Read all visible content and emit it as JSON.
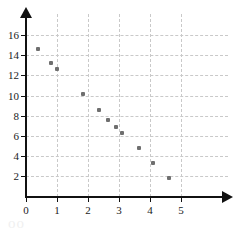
{
  "chart_data": {
    "type": "scatter",
    "title": "",
    "subtitle": "",
    "xlabel": "",
    "ylabel": "",
    "xlim": [
      0,
      5.7
    ],
    "ylim": [
      0,
      17.3
    ],
    "grid": true,
    "legend": null,
    "x_ticks": [
      "0",
      "1",
      "2",
      "3",
      "4",
      "5"
    ],
    "x_tick_values": [
      0,
      1,
      2,
      3,
      4,
      5
    ],
    "y_ticks": [
      "2",
      "4",
      "6",
      "8",
      "10",
      "12",
      "14",
      "16"
    ],
    "y_tick_values": [
      2,
      4,
      6,
      8,
      10,
      12,
      14,
      16
    ],
    "series": [
      {
        "name": "data",
        "marker": "square",
        "color": "#6f6f6f",
        "points": [
          {
            "x": 0.4,
            "y": 14.6
          },
          {
            "x": 0.8,
            "y": 13.2
          },
          {
            "x": 1.0,
            "y": 12.6
          },
          {
            "x": 1.85,
            "y": 10.1
          },
          {
            "x": 2.35,
            "y": 8.6
          },
          {
            "x": 2.65,
            "y": 7.6
          },
          {
            "x": 2.9,
            "y": 6.9
          },
          {
            "x": 3.1,
            "y": 6.3
          },
          {
            "x": 3.65,
            "y": 4.8
          },
          {
            "x": 4.1,
            "y": 3.3
          },
          {
            "x": 4.6,
            "y": 1.8
          }
        ]
      }
    ]
  },
  "style": {
    "axis_color": "#111111",
    "grid_color": "#c9c9c9",
    "point_color": "#6f6f6f",
    "background": "#ffffff"
  },
  "watermark": {
    "text": "oo"
  }
}
